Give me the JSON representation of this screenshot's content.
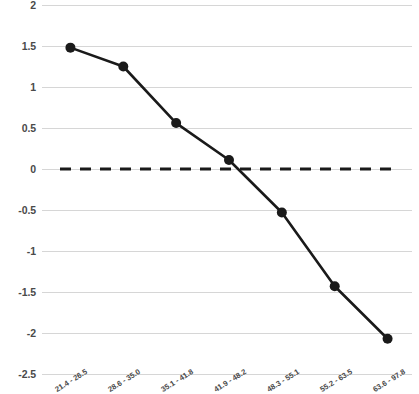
{
  "chart_data": {
    "type": "line",
    "title": "",
    "subtitle": "",
    "xlabel": "",
    "ylabel": "",
    "categories": [
      "21.4 - 26.5",
      "28.6 - 35.0",
      "35.1 - 41.8",
      "41.9 - 48.2",
      "48.3 - 55.1",
      "55.2 - 63.5",
      "63.6 - 97.8"
    ],
    "values": [
      1.48,
      1.25,
      0.56,
      0.11,
      -0.53,
      -1.43,
      -2.07
    ],
    "series": [
      {
        "name": "series-1",
        "values": [
          1.48,
          1.25,
          0.56,
          0.11,
          -0.53,
          -1.43,
          -2.07
        ]
      }
    ],
    "ylim": [
      -2.5,
      2
    ],
    "yticks": [
      2,
      1.5,
      1,
      0.5,
      0,
      -0.5,
      -1,
      -1.5,
      -2,
      -2.5
    ],
    "ytick_labels": [
      "2",
      "1.5",
      "1",
      "0.5",
      "0",
      "-0.5",
      "-1",
      "-1.5",
      "-2",
      "-2.5"
    ],
    "grid": true,
    "legend": "none",
    "reference_line": {
      "name": "zero-reference-line",
      "value": 0,
      "style": "dashed"
    },
    "colors": {
      "line": "#1a1a1a",
      "marker": "#1a1a1a",
      "grid": "#d6d6d6",
      "reference": "#1a1a1a",
      "text": "#4a4a4a",
      "background": "#ffffff"
    },
    "marker": "circle",
    "marker_size": 5,
    "line_width": 2.6
  }
}
